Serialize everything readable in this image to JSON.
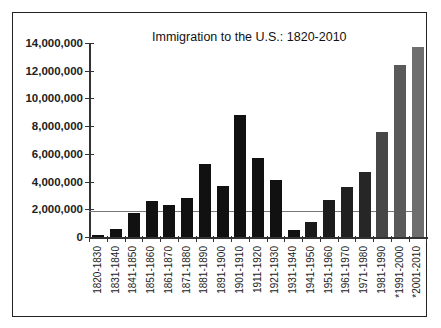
{
  "chart_data": {
    "type": "bar",
    "title": "Immigration to the U.S.: 1820-2010",
    "xlabel": "",
    "ylabel": "",
    "ylim": [
      0,
      14000000
    ],
    "yticks": [
      0,
      2000000,
      4000000,
      6000000,
      8000000,
      10000000,
      12000000,
      14000000
    ],
    "ytick_labels": [
      "0",
      "2,000,000",
      "4,000,000",
      "6,000,000",
      "8,000,000",
      "10,000,000",
      "12,000,000",
      "14,000,000"
    ],
    "categories": [
      "1820-1830",
      "1831-1840",
      "1841-1850",
      "1851-1860",
      "1861-1870",
      "1871-1880",
      "1881-1890",
      "1891-1900",
      "1901-1910",
      "1911-1920",
      "1921-1930",
      "1931-1940",
      "1941-1950",
      "1951-1960",
      "1961-1970",
      "1971-1980",
      "1981-1990",
      "*1991-2000",
      "*2001-2010"
    ],
    "values": [
      150000,
      600000,
      1700000,
      2600000,
      2300000,
      2800000,
      5250000,
      3700000,
      8800000,
      5700000,
      4100000,
      500000,
      1100000,
      2700000,
      3600000,
      4700000,
      7600000,
      12400000,
      13700000
    ],
    "bar_colors": [
      "#111111",
      "#111111",
      "#111111",
      "#111111",
      "#111111",
      "#111111",
      "#111111",
      "#111111",
      "#111111",
      "#111111",
      "#111111",
      "#111111",
      "#1a1a1a",
      "#1c1c1c",
      "#202020",
      "#262626",
      "#474747",
      "#5a5a5a",
      "#6e6e6e"
    ],
    "reference_line": {
      "value": 1850000,
      "color": "#777777"
    },
    "grid": false,
    "legend": null
  }
}
